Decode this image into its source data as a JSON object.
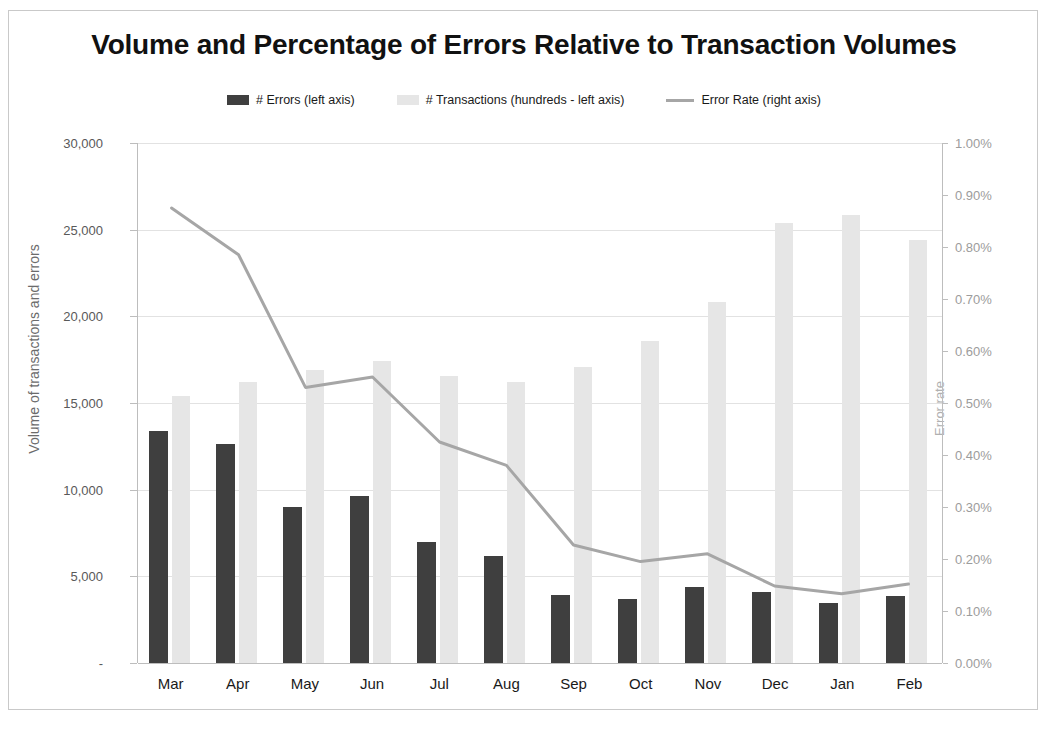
{
  "chart_data": {
    "type": "bar",
    "title": "Volume and Percentage of Errors Relative to Transaction Volumes",
    "xlabel": "",
    "ylabel": "Volume of transactions and errors",
    "y2label": "Error rate",
    "categories": [
      "Mar",
      "Apr",
      "May",
      "Jun",
      "Jul",
      "Aug",
      "Sep",
      "Oct",
      "Nov",
      "Dec",
      "Jan",
      "Feb"
    ],
    "ylim": [
      0,
      30000
    ],
    "y2lim": [
      0,
      1.0
    ],
    "grid": true,
    "legend_position": "top",
    "series": [
      {
        "name": "# Errors (left axis)",
        "type": "bar",
        "axis": "left",
        "color": "#3f3f3f",
        "values": [
          13400,
          12650,
          9000,
          9650,
          7000,
          6200,
          3950,
          3700,
          4400,
          4100,
          3450,
          3850
        ]
      },
      {
        "name": "# Transactions (hundreds - left axis)",
        "type": "bar",
        "axis": "left",
        "color": "#e6e6e6",
        "values": [
          15400,
          16200,
          16900,
          17400,
          16550,
          16200,
          17050,
          18600,
          20800,
          25400,
          25850,
          24400
        ]
      },
      {
        "name": "Error Rate (right axis)",
        "type": "line",
        "axis": "right",
        "color": "#a6a6a6",
        "values": [
          0.875,
          0.785,
          0.53,
          0.55,
          0.425,
          0.38,
          0.227,
          0.195,
          0.21,
          0.148,
          0.133,
          0.152
        ]
      }
    ],
    "yticks": [
      "30,000",
      "25,000",
      "20,000",
      "15,000",
      "10,000",
      "5,000",
      "-"
    ],
    "ytick_values": [
      30000,
      25000,
      20000,
      15000,
      10000,
      5000,
      0
    ],
    "y2ticks": [
      "1.00%",
      "0.90%",
      "0.80%",
      "0.70%",
      "0.60%",
      "0.50%",
      "0.40%",
      "0.30%",
      "0.20%",
      "0.10%",
      "0.00%"
    ],
    "y2tick_values": [
      1.0,
      0.9,
      0.8,
      0.7,
      0.6,
      0.5,
      0.4,
      0.3,
      0.2,
      0.1,
      0.0
    ]
  },
  "legend": {
    "items": [
      {
        "label": "# Errors (left axis)",
        "marker": "bar-swatch-dark",
        "color": "#3f3f3f"
      },
      {
        "label": "# Transactions (hundreds - left axis)",
        "marker": "bar-swatch-light",
        "color": "#e6e6e6"
      },
      {
        "label": "Error Rate (right axis)",
        "marker": "line-swatch",
        "color": "#a6a6a6"
      }
    ]
  }
}
